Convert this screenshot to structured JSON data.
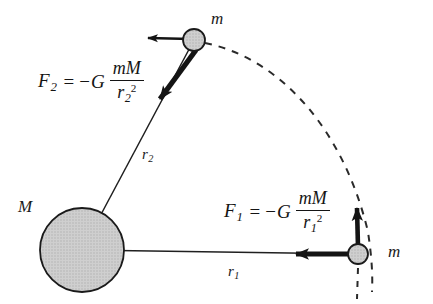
{
  "figure": {
    "background_color": "#ffffff",
    "ink_color": "#141414",
    "body_fill_color": "#c6c6c6",
    "body_stroke_color": "#1a1a1a"
  },
  "labels": {
    "central_mass": "M",
    "orbiting_mass_top": "m",
    "orbiting_mass_right": "m",
    "radius_1_base": "r",
    "radius_1_sub": "1",
    "radius_2_base": "r",
    "radius_2_sub": "2"
  },
  "formulas": [
    {
      "id": "force-1",
      "lhs_base": "F",
      "lhs_sub": "1",
      "equals": "=",
      "minus": "−",
      "constant": "G",
      "numerator": "mM",
      "denominator_base": "r",
      "denominator_sub": "1",
      "denominator_sup": "2",
      "plain_text": "F1 = -G mM / r1^2"
    },
    {
      "id": "force-2",
      "lhs_base": "F",
      "lhs_sub": "2",
      "equals": "=",
      "minus": "−",
      "constant": "G",
      "numerator": "mM",
      "denominator_base": "r",
      "denominator_sub": "2",
      "denominator_sup": "2",
      "plain_text": "F2 = -G mM / r2^2"
    }
  ],
  "geometry": {
    "central_body": {
      "cx": 82,
      "cy": 250,
      "r": 42
    },
    "mass_top": {
      "cx": 194,
      "cy": 40,
      "r": 11
    },
    "mass_right": {
      "cx": 358,
      "cy": 254,
      "r": 10
    },
    "radius_line_1": {
      "x1": 82,
      "y1": 250,
      "x2": 358,
      "y2": 254
    },
    "radius_line_2": {
      "x1": 82,
      "y1": 250,
      "x2": 194,
      "y2": 40
    },
    "orbit_arc": {
      "start": [
        205,
        43
      ],
      "end": [
        372,
        290
      ],
      "dashed": true
    },
    "vertical_dash": {
      "x": 358,
      "y1": 266,
      "y2": 298
    }
  },
  "vectors": [
    {
      "id": "velocity-top",
      "from": [
        194,
        40
      ],
      "to": [
        145,
        38
      ],
      "style": "thin",
      "direction": "left"
    },
    {
      "id": "force-top",
      "from": [
        194,
        51
      ],
      "to": [
        155,
        105
      ],
      "style": "thick",
      "direction": "down-left"
    },
    {
      "id": "velocity-right",
      "from": [
        358,
        248
      ],
      "to": [
        357,
        200
      ],
      "style": "thick",
      "direction": "up"
    },
    {
      "id": "force-right",
      "from": [
        348,
        254
      ],
      "to": [
        288,
        254
      ],
      "style": "thick",
      "direction": "left"
    }
  ]
}
